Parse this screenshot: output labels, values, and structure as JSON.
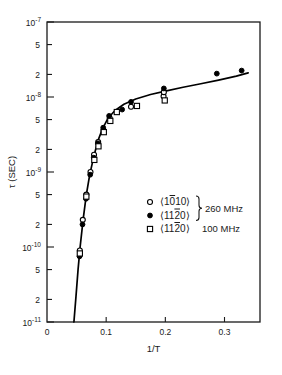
{
  "chart_data": {
    "type": "scatter",
    "title": "",
    "xlabel": "1/T",
    "ylabel": "τ (SEC)",
    "yscale": "log",
    "xscale": "linear",
    "xlim": [
      0,
      0.36
    ],
    "ylim": [
      1e-11,
      1e-07
    ],
    "grid": false,
    "legend_position": "center-right",
    "xticks": [
      {
        "value": 0,
        "label": "0"
      },
      {
        "value": 0.1,
        "label": "0.1"
      },
      {
        "value": 0.2,
        "label": "0.2"
      },
      {
        "value": 0.3,
        "label": "0.3"
      }
    ],
    "yticks": [
      {
        "value": 1e-07,
        "label": "10",
        "exp": "-7"
      },
      {
        "value": 5e-08,
        "label": "5",
        "exp": ""
      },
      {
        "value": 2e-08,
        "label": "2",
        "exp": ""
      },
      {
        "value": 1e-08,
        "label": "10",
        "exp": "-8"
      },
      {
        "value": 5e-09,
        "label": "5",
        "exp": ""
      },
      {
        "value": 2e-09,
        "label": "2",
        "exp": ""
      },
      {
        "value": 1e-09,
        "label": "10",
        "exp": "-9"
      },
      {
        "value": 5e-10,
        "label": "5",
        "exp": ""
      },
      {
        "value": 2e-10,
        "label": "2",
        "exp": ""
      },
      {
        "value": 1e-10,
        "label": "10",
        "exp": "-10"
      },
      {
        "value": 5e-11,
        "label": "5",
        "exp": ""
      },
      {
        "value": 2e-11,
        "label": "2",
        "exp": ""
      },
      {
        "value": 1e-11,
        "label": "10",
        "exp": "-11"
      }
    ],
    "curve": [
      {
        "x": 0.0455,
        "y": 1e-11
      },
      {
        "x": 0.049,
        "y": 2.2e-11
      },
      {
        "x": 0.0525,
        "y": 5e-11
      },
      {
        "x": 0.056,
        "y": 1e-10
      },
      {
        "x": 0.061,
        "y": 2.3e-10
      },
      {
        "x": 0.0665,
        "y": 5e-10
      },
      {
        "x": 0.072,
        "y": 9e-10
      },
      {
        "x": 0.079,
        "y": 1.6e-09
      },
      {
        "x": 0.086,
        "y": 2.6e-09
      },
      {
        "x": 0.094,
        "y": 3.8e-09
      },
      {
        "x": 0.103,
        "y": 5.2e-09
      },
      {
        "x": 0.115,
        "y": 6.6e-09
      },
      {
        "x": 0.13,
        "y": 8e-09
      },
      {
        "x": 0.15,
        "y": 9.4e-09
      },
      {
        "x": 0.175,
        "y": 1.08e-08
      },
      {
        "x": 0.2,
        "y": 1.2e-08
      },
      {
        "x": 0.23,
        "y": 1.35e-08
      },
      {
        "x": 0.26,
        "y": 1.5e-08
      },
      {
        "x": 0.29,
        "y": 1.68e-08
      },
      {
        "x": 0.32,
        "y": 1.9e-08
      },
      {
        "x": 0.34,
        "y": 2.1e-08
      }
    ],
    "series": [
      {
        "name": "⟨10̅1̅00⟩ 260 MHz",
        "marker": "open-circle",
        "points": [
          {
            "x": 0.0555,
            "y": 9e-11
          },
          {
            "x": 0.0605,
            "y": 2.3e-10
          },
          {
            "x": 0.0665,
            "y": 5e-10
          },
          {
            "x": 0.0735,
            "y": 1e-09
          },
          {
            "x": 0.0795,
            "y": 1.7e-09
          },
          {
            "x": 0.0865,
            "y": 2.5e-09
          },
          {
            "x": 0.0955,
            "y": 3.6e-09
          },
          {
            "x": 0.106,
            "y": 5.2e-09
          },
          {
            "x": 0.142,
            "y": 7.4e-09
          },
          {
            "x": 0.197,
            "y": 1.02e-08
          },
          {
            "x": 0.1975,
            "y": 1.16e-08
          }
        ]
      },
      {
        "name": "⟨11̅2̅0⟩ 260 MHz",
        "marker": "filled-circle",
        "points": [
          {
            "x": 0.055,
            "y": 7.5e-11
          },
          {
            "x": 0.06,
            "y": 2e-10
          },
          {
            "x": 0.066,
            "y": 4.4e-10
          },
          {
            "x": 0.073,
            "y": 9.2e-10
          },
          {
            "x": 0.079,
            "y": 1.55e-09
          },
          {
            "x": 0.086,
            "y": 2.4e-09
          },
          {
            "x": 0.095,
            "y": 3.9e-09
          },
          {
            "x": 0.105,
            "y": 5.6e-09
          },
          {
            "x": 0.127,
            "y": 6.8e-09
          },
          {
            "x": 0.142,
            "y": 8.6e-09
          },
          {
            "x": 0.1975,
            "y": 1.3e-08
          },
          {
            "x": 0.287,
            "y": 2.05e-08
          },
          {
            "x": 0.329,
            "y": 2.25e-08
          }
        ]
      },
      {
        "name": "⟨11̅2̅0⟩ 100 MHz",
        "marker": "open-square",
        "points": [
          {
            "x": 0.0555,
            "y": 8.2e-11
          },
          {
            "x": 0.0665,
            "y": 4.7e-10
          },
          {
            "x": 0.08,
            "y": 1.45e-09
          },
          {
            "x": 0.087,
            "y": 2.2e-09
          },
          {
            "x": 0.096,
            "y": 3.4e-09
          },
          {
            "x": 0.107,
            "y": 4.8e-09
          },
          {
            "x": 0.118,
            "y": 6.3e-09
          },
          {
            "x": 0.152,
            "y": 7.6e-09
          },
          {
            "x": 0.199,
            "y": 9e-09
          }
        ]
      }
    ],
    "legend": {
      "rows": [
        {
          "marker": "open-circle",
          "direction": "⟨1010⟩",
          "overbar_index": 1,
          "freq": ""
        },
        {
          "marker": "filled-circle",
          "direction": "⟨1120⟩",
          "overbar_index": 2,
          "freq": ""
        },
        {
          "marker": "open-square",
          "direction": "⟨1120⟩",
          "overbar_index": 2,
          "freq": "100 MHz"
        }
      ],
      "brace_label": "260 MHz",
      "third_label": "100 MHz"
    },
    "colors": {
      "axis": "#1a1a1a",
      "curve": "#000000",
      "marker": "#000000",
      "background": "#ffffff"
    }
  }
}
